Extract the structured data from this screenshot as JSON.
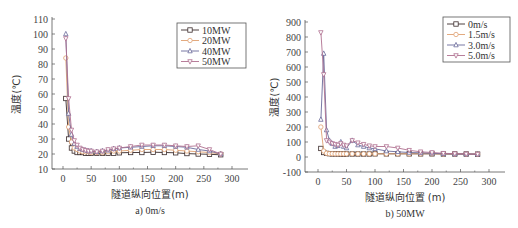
{
  "chart_data": [
    {
      "type": "line",
      "caption": "a) 0m/s",
      "xlabel": "隧道纵向位置(m)",
      "ylabel": "温度(℃)",
      "xlim": [
        -20,
        320
      ],
      "ylim": [
        10,
        110
      ],
      "xticks": [
        0,
        50,
        100,
        150,
        200,
        250,
        300
      ],
      "yticks": [
        10,
        20,
        30,
        40,
        50,
        60,
        70,
        80,
        90,
        100,
        110
      ],
      "legend_position": "upper right",
      "series": [
        {
          "name": "10MW",
          "color": "#3a2a2a",
          "marker": "square",
          "x": [
            5,
            10,
            15,
            20,
            25,
            30,
            35,
            40,
            45,
            50,
            60,
            70,
            80,
            90,
            100,
            120,
            140,
            160,
            180,
            200,
            220,
            240,
            260,
            280
          ],
          "y": [
            57,
            30,
            24,
            22,
            21,
            21,
            21,
            20.5,
            20.5,
            20.5,
            20.5,
            20.5,
            20.5,
            20.5,
            20.8,
            21,
            21,
            21.2,
            21,
            20.8,
            20.3,
            20,
            19.8,
            19.5
          ]
        },
        {
          "name": "20MW",
          "color": "#e0a070",
          "marker": "circle",
          "x": [
            5,
            10,
            15,
            20,
            25,
            30,
            35,
            40,
            45,
            50,
            60,
            70,
            80,
            90,
            100,
            120,
            140,
            160,
            180,
            200,
            220,
            240,
            260,
            280
          ],
          "y": [
            84,
            38,
            28,
            24,
            23,
            22,
            21.5,
            21.5,
            21.5,
            21,
            21,
            21,
            21.5,
            22,
            22,
            22.5,
            23,
            23,
            23,
            22.5,
            22,
            21.5,
            21,
            20
          ]
        },
        {
          "name": "40MW",
          "color": "#6a6a9a",
          "marker": "triangle-up",
          "x": [
            5,
            10,
            15,
            20,
            25,
            30,
            35,
            40,
            45,
            50,
            60,
            70,
            80,
            90,
            100,
            120,
            140,
            160,
            180,
            200,
            220,
            240,
            260,
            280
          ],
          "y": [
            100,
            47,
            33,
            27,
            25,
            23.5,
            23,
            22.5,
            22,
            22,
            21.5,
            22,
            22.5,
            23.5,
            24,
            24.5,
            25,
            25.5,
            25.5,
            25,
            24.5,
            23,
            22,
            20
          ]
        },
        {
          "name": "50MW",
          "color": "#b07090",
          "marker": "triangle-down",
          "x": [
            5,
            10,
            15,
            20,
            25,
            30,
            35,
            40,
            45,
            50,
            60,
            70,
            80,
            90,
            100,
            120,
            140,
            160,
            180,
            200,
            220,
            240,
            260,
            280
          ],
          "y": [
            97,
            57,
            36,
            29,
            26,
            24,
            23,
            22.5,
            22,
            22,
            21.5,
            22,
            23,
            23.5,
            24,
            25,
            26,
            26,
            26,
            25.5,
            25,
            25.5,
            23,
            20
          ]
        }
      ]
    },
    {
      "type": "line",
      "caption": "b) 50MW",
      "xlabel": "隧道纵向位置 (m)",
      "ylabel": "温度(℃)",
      "xlim": [
        -20,
        320
      ],
      "ylim": [
        -100,
        900
      ],
      "xticks": [
        0,
        50,
        100,
        150,
        200,
        250,
        300
      ],
      "yticks": [
        -100,
        0,
        100,
        200,
        300,
        400,
        500,
        600,
        700,
        800,
        900
      ],
      "legend_position": "upper right",
      "series": [
        {
          "name": "0m/s",
          "color": "#3a2a2a",
          "marker": "square",
          "x": [
            5,
            10,
            15,
            20,
            25,
            30,
            35,
            40,
            45,
            50,
            60,
            70,
            80,
            90,
            100,
            120,
            140,
            160,
            180,
            200,
            220,
            240,
            260,
            280
          ],
          "y": [
            57,
            30,
            24,
            22,
            21,
            21,
            21,
            20,
            20,
            20,
            20,
            20,
            20,
            20,
            21,
            21,
            21,
            21,
            21,
            21,
            20,
            20,
            20,
            19
          ]
        },
        {
          "name": "1.5m/s",
          "color": "#e0a070",
          "marker": "circle",
          "x": [
            5,
            10,
            15,
            20,
            25,
            30,
            35,
            40,
            45,
            50,
            60,
            70,
            80,
            90,
            100,
            120,
            140,
            160,
            180,
            200,
            220,
            240,
            260,
            280
          ],
          "y": [
            200,
            40,
            25,
            22,
            22,
            21,
            21,
            21,
            21,
            21,
            21,
            21,
            21,
            21,
            21,
            21,
            21,
            21,
            21,
            21,
            20,
            20,
            20,
            19
          ]
        },
        {
          "name": "3.0m/s",
          "color": "#6a6a9a",
          "marker": "triangle-up",
          "x": [
            5,
            10,
            15,
            20,
            25,
            30,
            35,
            40,
            45,
            50,
            60,
            70,
            80,
            90,
            100,
            120,
            140,
            160,
            180,
            200,
            220,
            240,
            260,
            280
          ],
          "y": [
            250,
            690,
            180,
            110,
            90,
            70,
            75,
            100,
            70,
            60,
            110,
            80,
            70,
            60,
            55,
            40,
            35,
            30,
            28,
            25,
            22,
            20,
            20,
            19
          ]
        },
        {
          "name": "5.0m/s",
          "color": "#b07090",
          "marker": "triangle-down",
          "x": [
            5,
            10,
            15,
            20,
            25,
            30,
            35,
            40,
            45,
            50,
            60,
            70,
            80,
            90,
            100,
            120,
            140,
            160,
            180,
            200,
            220,
            240,
            260,
            280
          ],
          "y": [
            830,
            550,
            110,
            100,
            90,
            85,
            80,
            90,
            80,
            75,
            110,
            95,
            85,
            75,
            70,
            70,
            60,
            45,
            35,
            30,
            25,
            22,
            20,
            19
          ]
        }
      ]
    }
  ]
}
